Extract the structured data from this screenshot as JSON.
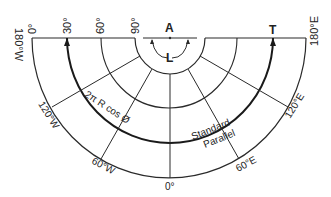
{
  "diagram": {
    "type": "polar-projection-half-circle",
    "colors": {
      "line": "#2a2a2a",
      "background": "#ffffff"
    },
    "top_labels": {
      "lat_0": "0°",
      "lat_30": "30°",
      "lat_60": "60°",
      "lat_90": "90°",
      "point_a": "A",
      "angle_l": "L",
      "point_t": "T"
    },
    "side_labels": {
      "left": "180°W",
      "right": "180°E"
    },
    "meridian_labels": {
      "w120": "120°W",
      "w60": "60°W",
      "zero": "0°",
      "e60": "60°E",
      "e120": "120°E"
    },
    "annotations": {
      "circumference": "2π R cos Ø",
      "standard": "Standard",
      "parallel": "Parallel"
    }
  }
}
